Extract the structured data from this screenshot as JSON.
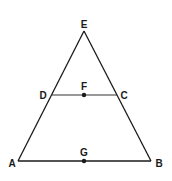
{
  "diagram": {
    "type": "geometry",
    "stroke_color": "#1a1a1a",
    "points": {
      "E": {
        "label": "E",
        "x": 84,
        "y": 31
      },
      "D": {
        "label": "D",
        "x": 51,
        "y": 95
      },
      "C": {
        "label": "C",
        "x": 117,
        "y": 95
      },
      "F": {
        "label": "F",
        "x": 84,
        "y": 95
      },
      "A": {
        "label": "A",
        "x": 18,
        "y": 161
      },
      "B": {
        "label": "B",
        "x": 151,
        "y": 161
      },
      "G": {
        "label": "G",
        "x": 84,
        "y": 161
      }
    },
    "segments": [
      "EA",
      "EB",
      "AB",
      "DC"
    ],
    "marked_points": [
      "F",
      "G"
    ]
  }
}
